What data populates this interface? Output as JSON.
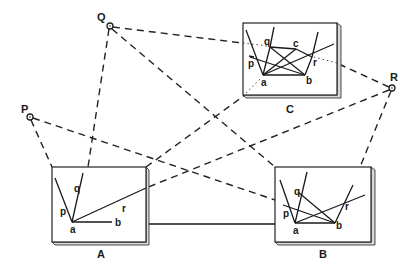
{
  "figure": {
    "viewpoints": [
      {
        "id": "P",
        "label": "P",
        "x": 30,
        "y": 117
      },
      {
        "id": "Q",
        "label": "Q",
        "x": 110,
        "y": 26
      },
      {
        "id": "R",
        "label": "R",
        "x": 392,
        "y": 88
      }
    ],
    "panels": [
      {
        "id": "A",
        "label": "A",
        "vertex_labels": {
          "a": "a",
          "b": "b",
          "p": "p",
          "q": "q",
          "r": "r"
        }
      },
      {
        "id": "B",
        "label": "B",
        "vertex_labels": {
          "a": "a",
          "b": "b",
          "p": "p",
          "q": "q",
          "r": "r"
        }
      },
      {
        "id": "C",
        "label": "C",
        "vertex_labels": {
          "a": "a",
          "b": "b",
          "c": "c",
          "p": "p",
          "q": "q",
          "r": "r"
        }
      }
    ],
    "connections": {
      "dashed": [
        "Q-A",
        "Q-B",
        "Q-C",
        "P-A",
        "P-B",
        "R-A",
        "R-B",
        "R-C",
        "A-C"
      ],
      "solid": [
        "A-B"
      ]
    }
  }
}
